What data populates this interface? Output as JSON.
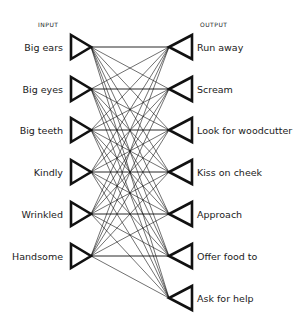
{
  "headers": {
    "input": "INPUT",
    "output": "OUTPUT"
  },
  "inputs": [
    {
      "label": "Big ears",
      "y": 47
    },
    {
      "label": "Big eyes",
      "y": 89
    },
    {
      "label": "Big teeth",
      "y": 130
    },
    {
      "label": "Kindly",
      "y": 172
    },
    {
      "label": "Wrinkled",
      "y": 214
    },
    {
      "label": "Handsome",
      "y": 256
    }
  ],
  "outputs": [
    {
      "label": "Run away",
      "y": 47
    },
    {
      "label": "Scream",
      "y": 89
    },
    {
      "label": "Look for woodcutter",
      "y": 130
    },
    {
      "label": "Kiss on cheek",
      "y": 172
    },
    {
      "label": "Approach",
      "y": 214
    },
    {
      "label": "Offer food to",
      "y": 256
    },
    {
      "label": "Ask for help",
      "y": 298
    }
  ],
  "connectivity": "fully-connected",
  "colors": {
    "stroke": "#111111",
    "background": "#ffffff"
  }
}
